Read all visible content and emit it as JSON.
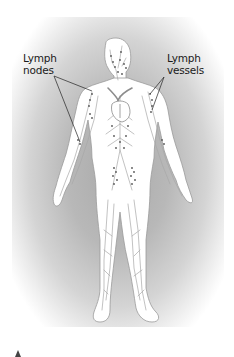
{
  "figure": {
    "background": "radial gray gradient",
    "colors": {
      "body_fill": "#ffffff",
      "body_outline": "#9a9a9a",
      "vessel_line": "#a8a8a8",
      "node_dot": "#555555",
      "heart_vessels": "#8c8c8c",
      "leader_line": "#222222",
      "label_text": "#1a1a1a"
    },
    "labels": {
      "nodes_line1": "Lymph",
      "nodes_line2": "nodes",
      "vessels_line1": "Lymph",
      "vessels_line2": "vessels"
    }
  },
  "footer": {
    "marker_icon": "triangle-up-icon"
  }
}
